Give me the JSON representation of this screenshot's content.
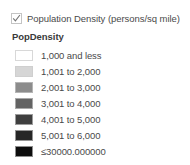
{
  "layer": {
    "checked": true,
    "checkbox_icon": "checkmark-icon",
    "title": "Population Density (persons/sq mile)"
  },
  "symbology": {
    "field_name": "PopDensity",
    "type": "graduated-colors",
    "classes": [
      {
        "label": "1,000 and less",
        "color": "#ffffff",
        "border": "#d8d8d8"
      },
      {
        "label": "1,001 to 2,000",
        "color": "#d6d6d6",
        "border": "#cfcfcf"
      },
      {
        "label": "2,001 to 3,000",
        "color": "#8c8c8c",
        "border": "#b5b5b5"
      },
      {
        "label": "3,001 to 4,000",
        "color": "#636363",
        "border": "#a8a8a8"
      },
      {
        "label": "4,001 to 5,000",
        "color": "#3f3f3f",
        "border": "#9c9c9c"
      },
      {
        "label": "5,001 to 6,000",
        "color": "#262626",
        "border": "#949494"
      },
      {
        "label": "≤30000.000000",
        "color": "#0d0d0d",
        "border": "#8e8e8e"
      }
    ]
  }
}
